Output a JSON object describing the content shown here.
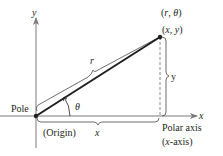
{
  "diagram": {
    "point_labels": {
      "polar": "(r, θ)",
      "rectangular": "(x, y)"
    },
    "axis_labels": {
      "x_arrow": "x",
      "y_arrow": "y"
    },
    "segment_labels": {
      "r": "r",
      "y": "y",
      "x": "x",
      "theta": "θ"
    },
    "text_labels": {
      "pole": "Pole",
      "origin": "(Origin)",
      "polar_axis": "Polar axis",
      "x_axis_note": "(x-axis)"
    },
    "colors": {
      "ink": "#231f20",
      "axis": "#7a7a7a",
      "dashed": "#8a8a8a"
    }
  }
}
